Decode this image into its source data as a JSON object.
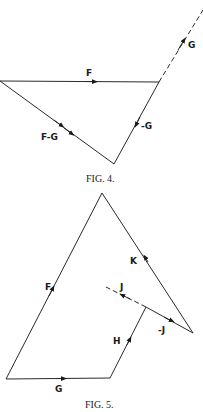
{
  "figures": [
    {
      "caption": "FIG. 4.",
      "labels": {
        "F": "F",
        "G": "G",
        "neg_G": "-G",
        "F_minus_G": "F-G"
      }
    },
    {
      "caption": "FIG. 5.",
      "labels": {
        "F": "F",
        "G": "G",
        "H": "H",
        "J": "J",
        "neg_J": "-J",
        "K": "K"
      }
    }
  ],
  "colors": {
    "line": "#2a2a2a",
    "text": "#1a1a1a"
  }
}
